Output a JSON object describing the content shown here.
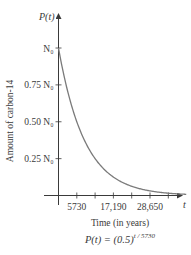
{
  "chart_data": {
    "type": "line",
    "title": "",
    "formula": "P(t) = (0.5)^(t/5730)",
    "formula_parts": {
      "lhs": "P(t) = (0.5)",
      "exponent": "t / 5730"
    },
    "xlabel": "Time (in years)",
    "ylabel": "Amount of carbon-14",
    "x_axis_var": "t",
    "y_axis_var": "P(t)",
    "x_ticks": [
      5730,
      11460,
      17190,
      22920,
      28650,
      34380
    ],
    "x_tick_labels": [
      "5730",
      "",
      "17,190",
      "",
      "28,650",
      ""
    ],
    "y_ticks": [
      1.0,
      0.75,
      0.5,
      0.25
    ],
    "y_tick_labels": [
      "N₀",
      "0.75 N₀",
      "0.50 N₀",
      "0.25 N₀"
    ],
    "xlim": [
      0,
      40000
    ],
    "ylim": [
      0,
      1.25
    ],
    "grid": false,
    "series": [
      {
        "name": "P(t)",
        "x": [
          0,
          5730,
          11460,
          17190,
          22920,
          28650,
          34380,
          40000
        ],
        "values": [
          1.0,
          0.5,
          0.25,
          0.125,
          0.0625,
          0.03125,
          0.015625,
          0.0079
        ]
      }
    ],
    "colors": {
      "curve": "#7a7a7a",
      "axis": "#3a3a3a"
    }
  }
}
